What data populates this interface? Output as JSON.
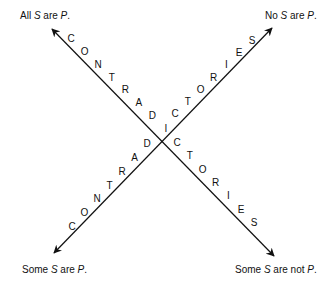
{
  "diagram": {
    "center": [
      164,
      140
    ],
    "corners": {
      "top_left": {
        "prefix": "All ",
        "s": "S",
        "mid": " are ",
        "p": "P",
        "suffix": "."
      },
      "top_right": {
        "prefix": "No ",
        "s": "S",
        "mid": " are ",
        "p": "P",
        "suffix": "."
      },
      "bottom_left": {
        "prefix": "Some ",
        "s": "S",
        "mid": " are ",
        "p": "P",
        "suffix": "."
      },
      "bottom_right": {
        "prefix": "Some ",
        "s": "S",
        "mid": " are not ",
        "p": "P",
        "suffix": "."
      }
    },
    "lines": [
      {
        "name": "all-to-some-not",
        "from": [
          52,
          29
        ],
        "to": [
          274,
          256
        ],
        "label": "CONTRADICTORIES"
      },
      {
        "name": "some-to-no",
        "from": [
          54,
          253
        ],
        "to": [
          272,
          28
        ],
        "label": "CONTRADICTORIES"
      }
    ],
    "letters_nw_se": {
      "upper": [
        "C",
        "O",
        "N",
        "T",
        "R",
        "A",
        "D",
        "I"
      ],
      "lower": [
        "C",
        "T",
        "O",
        "R",
        "I",
        "E",
        "S"
      ]
    },
    "letters_sw_ne": {
      "lower": [
        "C",
        "O",
        "N",
        "T",
        "R",
        "A",
        "D"
      ],
      "upper": [
        "C",
        "T",
        "O",
        "R",
        "I",
        "E",
        "S"
      ]
    }
  }
}
